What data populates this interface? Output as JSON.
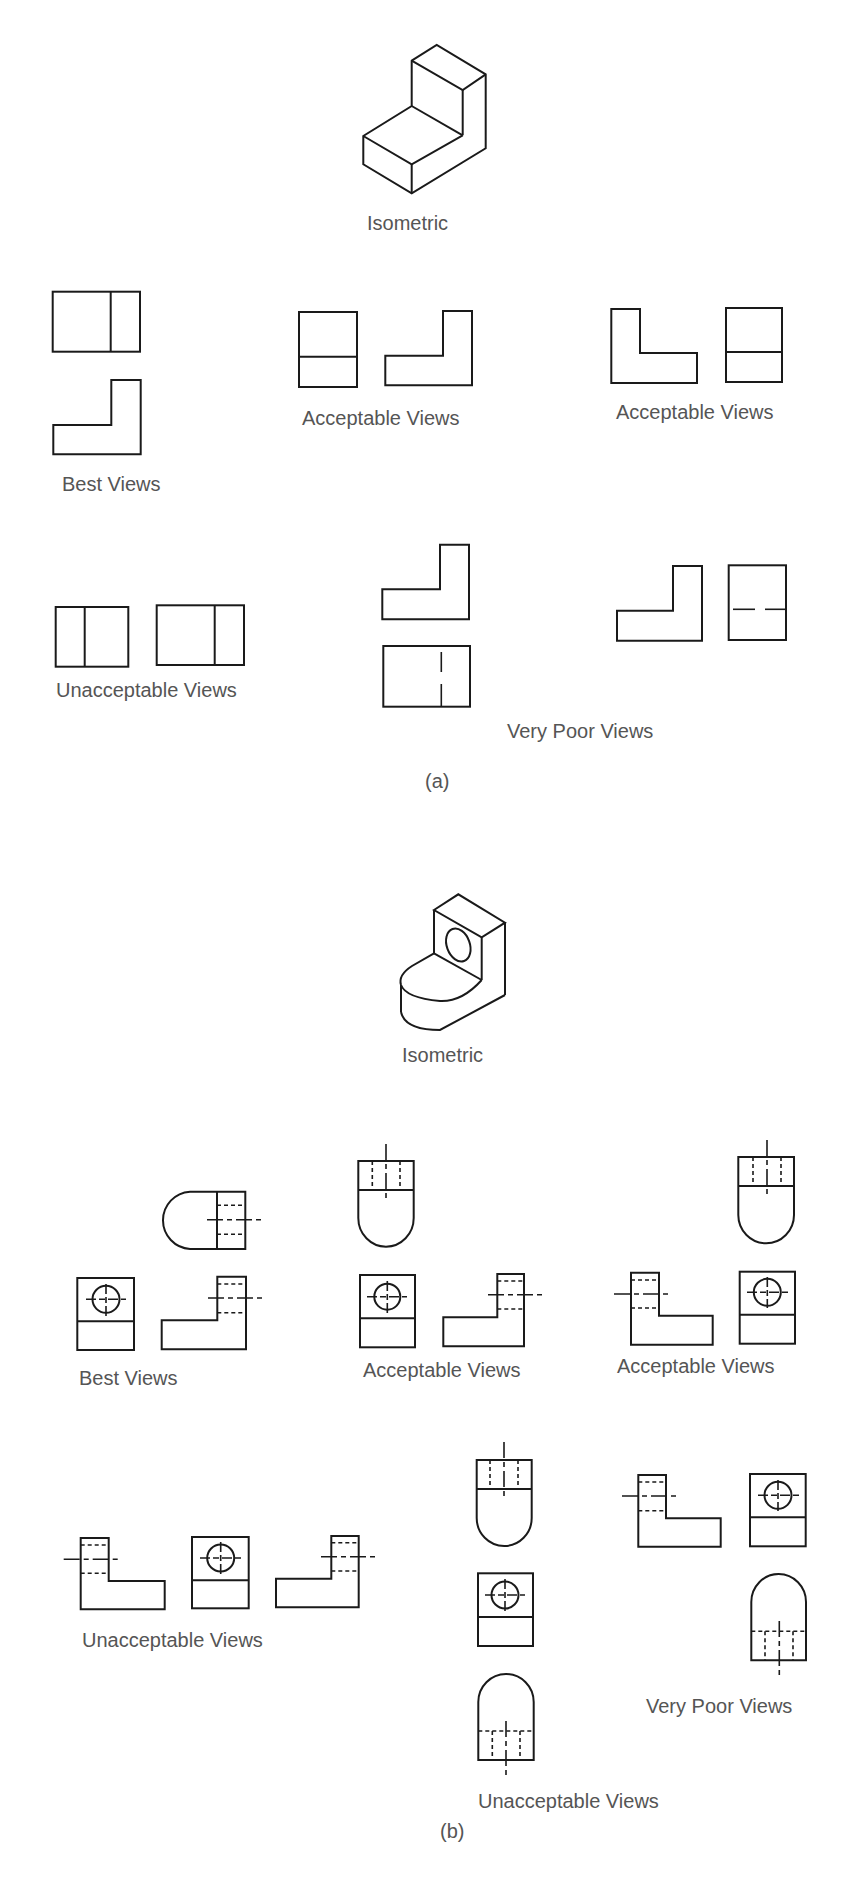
{
  "figure": {
    "part_a": {
      "label": "(a)",
      "isometric_label": "Isometric",
      "groups": [
        {
          "id": "best",
          "label": "Best Views"
        },
        {
          "id": "acceptable-1",
          "label": "Acceptable Views"
        },
        {
          "id": "acceptable-2",
          "label": "Acceptable Views"
        },
        {
          "id": "unacceptable",
          "label": "Unacceptable Views"
        },
        {
          "id": "very-poor",
          "label": "Very Poor Views"
        }
      ]
    },
    "part_b": {
      "label": "(b)",
      "isometric_label": "Isometric",
      "groups": [
        {
          "id": "best",
          "label": "Best Views"
        },
        {
          "id": "acceptable-1",
          "label": "Acceptable Views"
        },
        {
          "id": "acceptable-2",
          "label": "Acceptable Views"
        },
        {
          "id": "unacceptable-1",
          "label": "Unacceptable Views"
        },
        {
          "id": "unacceptable-2",
          "label": "Unacceptable Views"
        },
        {
          "id": "very-poor",
          "label": "Very Poor Views"
        }
      ]
    }
  },
  "colors": {
    "line": "#1a1a1a",
    "text": "#555555",
    "background": "#ffffff"
  }
}
